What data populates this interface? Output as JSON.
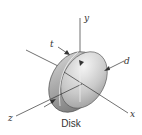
{
  "figure": {
    "caption": "Disk",
    "axes": {
      "x": "x",
      "y": "y",
      "z": "z"
    },
    "dimensions": {
      "thickness": "t",
      "diameter": "d"
    },
    "colors": {
      "line": "#333333",
      "disk_light": "#e8e8e8",
      "disk_dark": "#8a8a8a"
    }
  }
}
